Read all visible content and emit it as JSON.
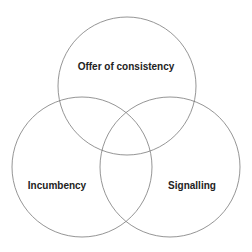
{
  "diagram": {
    "type": "venn",
    "stroke_color": "#7a7a7a",
    "sets": [
      {
        "label": "Offer of consistency",
        "cx": 127,
        "cy": 86,
        "r": 69,
        "label_x": 126,
        "label_y": 66
      },
      {
        "label": "Incumbency",
        "cx": 82,
        "cy": 167,
        "r": 70,
        "label_x": 57,
        "label_y": 185
      },
      {
        "label": "Signalling",
        "cx": 170,
        "cy": 167,
        "r": 70,
        "label_x": 192,
        "label_y": 185
      }
    ]
  }
}
